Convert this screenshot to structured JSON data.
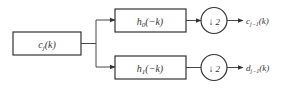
{
  "diagram": {
    "type": "filter-bank-decomposition",
    "input": {
      "label": "c_j(k)",
      "main": "c",
      "sub": "j",
      "arg": "(k)"
    },
    "branches": [
      {
        "filter": {
          "label": "h0(-k)",
          "main": "h",
          "sub": "0",
          "arg": "(−k)"
        },
        "downsample": {
          "label": "↓ 2",
          "arrow": "↓",
          "factor": "2"
        },
        "output": {
          "label": "c_{j-1}(k)",
          "main": "c",
          "sub": "j−1",
          "arg": "(k)"
        }
      },
      {
        "filter": {
          "label": "h1(-k)",
          "main": "h",
          "sub": "1",
          "arg": "(−k)"
        },
        "downsample": {
          "label": "↓ 2",
          "arrow": "↓",
          "factor": "2"
        },
        "output": {
          "label": "d_{j-1}(k)",
          "main": "d",
          "sub": "j−1",
          "arg": "(k)"
        }
      }
    ],
    "colors": {
      "stroke": "#333333",
      "text": "#333333",
      "background": "#ffffff"
    }
  }
}
